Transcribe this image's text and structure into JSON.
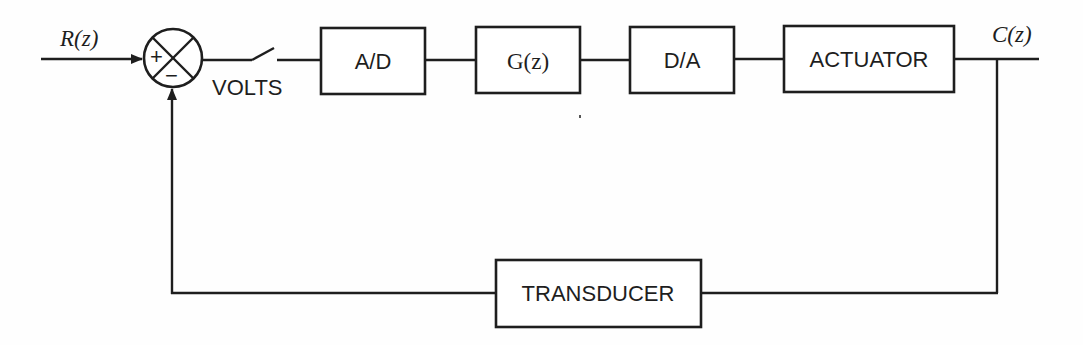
{
  "diagram": {
    "type": "block-diagram",
    "colors": {
      "ink": "#1e1e1e",
      "background": "#fefefe"
    },
    "input_signal": {
      "label": "R(z)"
    },
    "output_signal": {
      "label": "C(z)"
    },
    "summing_junction": {
      "plus_sign": "+",
      "minus_sign": "−"
    },
    "switch": {
      "label": "VOLTS"
    },
    "forward_blocks": [
      {
        "id": "ad",
        "label": "A/D"
      },
      {
        "id": "gz",
        "label": "G(z)"
      },
      {
        "id": "da",
        "label": "D/A"
      },
      {
        "id": "actuator",
        "label": "ACTUATOR"
      }
    ],
    "feedback_block": {
      "id": "transducer",
      "label": "TRANSDUCER"
    },
    "connections": [
      "R(z) -> summing_junction(+)",
      "summing_junction -> switch",
      "switch -> A/D",
      "A/D -> G(z)",
      "G(z) -> D/A",
      "D/A -> ACTUATOR",
      "ACTUATOR -> C(z)",
      "C(z) -> TRANSDUCER",
      "TRANSDUCER -> summing_junction(-)"
    ]
  }
}
